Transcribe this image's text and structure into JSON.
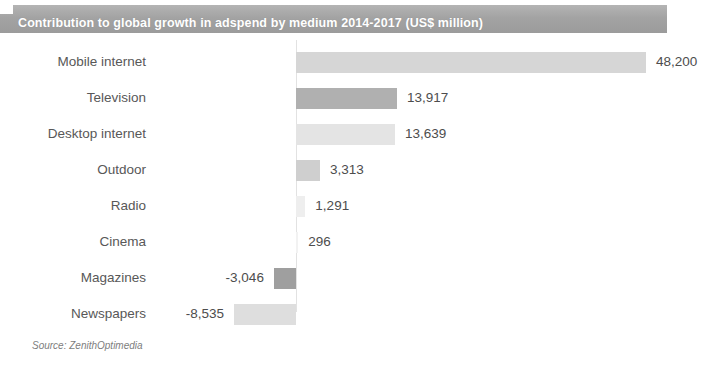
{
  "header": {
    "title": "Contribution to global growth in adspend by medium 2014-2017 (US$ million)",
    "banner_color": "#a3a3a3",
    "title_color": "#ffffff"
  },
  "footer": {
    "source": "Source: ZenithOptimedia"
  },
  "chart_data": {
    "type": "bar",
    "orientation": "horizontal",
    "title": "Contribution to global growth in adspend by medium 2014-2017 (US$ million)",
    "xlabel": "",
    "ylabel": "",
    "grid": false,
    "legend": "none",
    "axis_ticks_visible": false,
    "value_labels_visible": true,
    "xlim": [
      -10000,
      52000
    ],
    "categories": [
      "Mobile internet",
      "Television",
      "Desktop internet",
      "Outdoor",
      "Radio",
      "Cinema",
      "Magazines",
      "Newspapers"
    ],
    "values": [
      48200,
      13917,
      13639,
      3313,
      1291,
      296,
      -3046,
      -8535
    ],
    "value_labels": [
      "48,200",
      "13,917",
      "13,639",
      "3,313",
      "1,291",
      "296",
      "-3,046",
      "-8,535"
    ],
    "bar_colors": [
      "#d6d6d6",
      "#b0b0b0",
      "#e4e4e4",
      "#cfcfcf",
      "#eeeeee",
      "#f2f2f2",
      "#9f9f9f",
      "#dedede"
    ]
  }
}
